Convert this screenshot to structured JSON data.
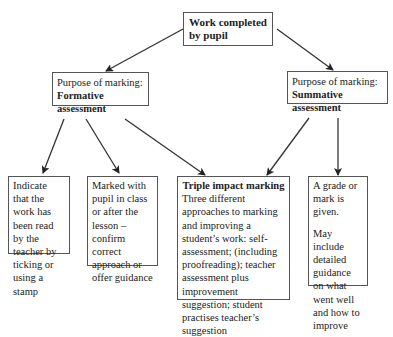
{
  "diagram": {
    "root": {
      "line1": "Work completed",
      "line2": "by pupil"
    },
    "formative": {
      "line1": "Purpose of marking:",
      "line2": "Formative assessment"
    },
    "summative": {
      "line1": "Purpose of marking:",
      "line2": "Summative assessment"
    },
    "leaf_indicate": {
      "text": "Indicate that the work has been read by the teacher by ticking or using a stamp"
    },
    "leaf_marked": {
      "text": "Marked with pupil in class or after the lesson – confirm correct approach or offer guidance"
    },
    "leaf_triple": {
      "title": "Triple impact marking",
      "text": "Three different approaches to marking and improving a student’s work: self-assessment; (including proofreading); teacher assessment plus improvement suggestion; student practises teacher’s suggestion"
    },
    "leaf_grade": {
      "text1": "A grade or mark is given.",
      "text2": "May include detailed guidance on what went well and how to improve"
    }
  }
}
